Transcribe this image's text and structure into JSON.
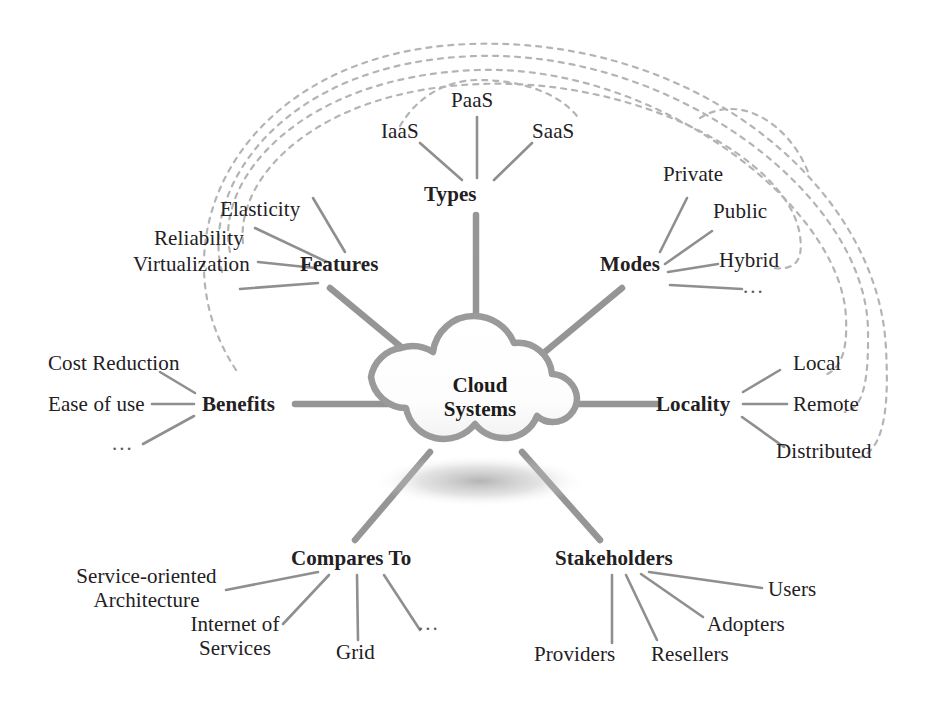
{
  "diagram": {
    "center": {
      "line1": "Cloud",
      "line2": "Systems",
      "icon": "cloud-icon"
    },
    "colors": {
      "spoke": "#8d8d8d",
      "twig": "#8f8f8f",
      "dashed": "#b4b4b4",
      "cloud_outline": "#9a9a9a",
      "cloud_fill": "#ffffff",
      "text": "#23201f",
      "background": "#ffffff"
    },
    "branches": [
      {
        "id": "types",
        "label": "Types",
        "leaves": [
          {
            "id": "iaas",
            "label": "IaaS"
          },
          {
            "id": "paas",
            "label": "PaaS"
          },
          {
            "id": "saas",
            "label": "SaaS"
          }
        ]
      },
      {
        "id": "features",
        "label": "Features",
        "leaves": [
          {
            "id": "elasticity",
            "label": "Elasticity"
          },
          {
            "id": "reliability",
            "label": "Reliability"
          },
          {
            "id": "virtualization",
            "label": "Virtualization"
          },
          {
            "id": "features-more",
            "label": ""
          }
        ]
      },
      {
        "id": "benefits",
        "label": "Benefits",
        "leaves": [
          {
            "id": "cost-reduction",
            "label": "Cost Reduction"
          },
          {
            "id": "ease-of-use",
            "label": "Ease of use"
          },
          {
            "id": "benefits-more",
            "label": "..."
          }
        ]
      },
      {
        "id": "modes",
        "label": "Modes",
        "leaves": [
          {
            "id": "private",
            "label": "Private"
          },
          {
            "id": "public",
            "label": "Public"
          },
          {
            "id": "hybrid",
            "label": "Hybrid"
          },
          {
            "id": "modes-more",
            "label": "..."
          }
        ]
      },
      {
        "id": "locality",
        "label": "Locality",
        "leaves": [
          {
            "id": "local",
            "label": "Local"
          },
          {
            "id": "remote",
            "label": "Remote"
          },
          {
            "id": "distributed",
            "label": "Distributed"
          }
        ]
      },
      {
        "id": "compares-to",
        "label": "Compares To",
        "leaves": [
          {
            "id": "soa",
            "label": "Service-oriented\nArchitecture"
          },
          {
            "id": "ios",
            "label": "Internet of\nServices"
          },
          {
            "id": "grid",
            "label": "Grid"
          },
          {
            "id": "compares-more",
            "label": "..."
          }
        ]
      },
      {
        "id": "stakeholders",
        "label": "Stakeholders",
        "leaves": [
          {
            "id": "users",
            "label": "Users"
          },
          {
            "id": "adopters",
            "label": "Adopters"
          },
          {
            "id": "resellers",
            "label": "Resellers"
          },
          {
            "id": "providers",
            "label": "Providers"
          }
        ]
      }
    ],
    "cross_links": [
      {
        "from": "elasticity",
        "to": "distributed"
      },
      {
        "from": "reliability",
        "to": "remote"
      },
      {
        "from": "virtualization",
        "to": "local"
      },
      {
        "from": "cost-reduction",
        "to": "hybrid"
      },
      {
        "from": "iaas",
        "to": "public"
      }
    ]
  }
}
